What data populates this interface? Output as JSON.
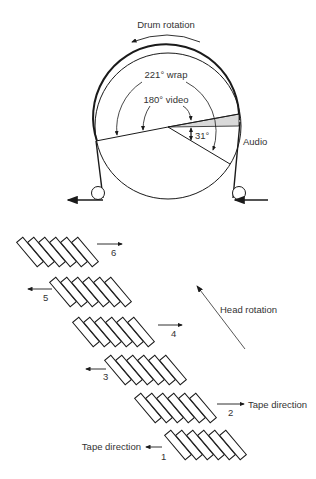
{
  "drum": {
    "rotation_label": "Drum rotation",
    "wrap_label": "221° wrap",
    "video_label": "180° video",
    "angle_label": "31°",
    "audio_label": "Audio"
  },
  "tracks": {
    "head_rotation_label": "Head rotation",
    "tape_direction_right": "Tape direction",
    "tape_direction_left": "Tape direction",
    "groups": [
      {
        "number": "1",
        "arrow": "left"
      },
      {
        "number": "2",
        "arrow": "right"
      },
      {
        "number": "3",
        "arrow": "left"
      },
      {
        "number": "4",
        "arrow": "right"
      },
      {
        "number": "5",
        "arrow": "left"
      },
      {
        "number": "6",
        "arrow": "right"
      }
    ]
  },
  "colors": {
    "line": "#1a1a1a",
    "audio_fill": "#d9d9d9"
  }
}
